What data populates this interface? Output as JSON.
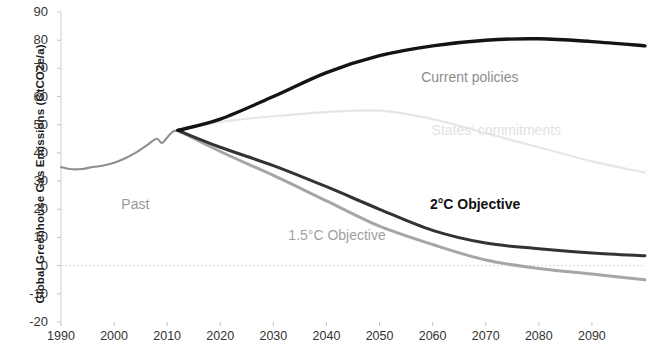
{
  "chart_data": {
    "type": "line",
    "title": "",
    "xlabel": "",
    "ylabel": "Global Greenhouse Gas Emissions (GtCO2e/a)",
    "xlim": [
      1990,
      2100
    ],
    "ylim": [
      -20,
      90
    ],
    "xticks": [
      "1990",
      "2000",
      "2010",
      "2020",
      "2030",
      "2040",
      "2050",
      "2060",
      "2070",
      "2080",
      "2090"
    ],
    "yticks": [
      "90",
      "80",
      "70",
      "60",
      "50",
      "40",
      "30",
      "20",
      "10",
      "0",
      "-10",
      "-20"
    ],
    "grid": false,
    "zero_line": true,
    "legend_position": "inline-annotations",
    "series": [
      {
        "name": "Past",
        "color": "#8f8f8f",
        "label": "Past",
        "x": [
          1990,
          1992,
          1994,
          1996,
          1998,
          2000,
          2002,
          2004,
          2006,
          2008,
          2009,
          2010,
          2011,
          2012
        ],
        "values": [
          35,
          34.2,
          34.3,
          35,
          35.5,
          36.5,
          38,
          40,
          42.5,
          45,
          43.5,
          45.5,
          47.5,
          48
        ]
      },
      {
        "name": "Current policies",
        "color": "#141414",
        "label": "Current policies",
        "x": [
          2012,
          2020,
          2030,
          2040,
          2050,
          2060,
          2070,
          2080,
          2090,
          2100
        ],
        "values": [
          48,
          52,
          60,
          68.5,
          74.5,
          78,
          80,
          80.5,
          79.5,
          78
        ]
      },
      {
        "name": "States' commitments",
        "color": "#e6e6e6",
        "label": "States' commitments",
        "x": [
          2012,
          2020,
          2030,
          2040,
          2050,
          2060,
          2070,
          2080,
          2090,
          2100
        ],
        "values": [
          48,
          51,
          53,
          54.5,
          55,
          52,
          47,
          42,
          37,
          33
        ]
      },
      {
        "name": "2°C Objective",
        "color": "#333333",
        "label": "2°C Objective",
        "x": [
          2012,
          2020,
          2030,
          2040,
          2050,
          2060,
          2070,
          2080,
          2090,
          2100
        ],
        "values": [
          48,
          42,
          35.5,
          28,
          20,
          12.5,
          8,
          6,
          4.5,
          3.5
        ]
      },
      {
        "name": "1.5°C Objective",
        "color": "#a6a6a6",
        "label": "1.5°C Objective",
        "x": [
          2012,
          2020,
          2030,
          2040,
          2050,
          2060,
          2070,
          2080,
          2090,
          2100
        ],
        "values": [
          48,
          40.5,
          32,
          23,
          14,
          7.5,
          2,
          -1,
          -3,
          -5
        ]
      }
    ],
    "annotations": [
      {
        "text": "Past",
        "x": 2004,
        "y": 22
      },
      {
        "text": "Current policies",
        "x": 2067,
        "y": 67
      },
      {
        "text": "States' commitments",
        "x": 2072,
        "y": 48
      },
      {
        "text": "2°C Objective",
        "x": 2068,
        "y": 22
      },
      {
        "text": "1.5°C Objective",
        "x": 2042,
        "y": 11
      }
    ]
  }
}
